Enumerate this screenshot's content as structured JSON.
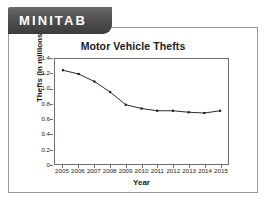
{
  "banner": {
    "wordmark": "MINITAB"
  },
  "chart_data": {
    "type": "line",
    "title": "Motor Vehicle Thefts",
    "xlabel": "Year",
    "ylabel": "Thefts (in millions)",
    "categories": [
      2005,
      2006,
      2007,
      2008,
      2009,
      2010,
      2011,
      2012,
      2013,
      2014,
      2015
    ],
    "x_tick_labels": [
      "2005",
      "2006",
      "2007",
      "2008",
      "2009",
      "2010",
      "2011",
      "2012",
      "2013",
      "2014",
      "2015"
    ],
    "values": [
      1.25,
      1.2,
      1.1,
      0.96,
      0.79,
      0.74,
      0.71,
      0.71,
      0.69,
      0.68,
      0.71
    ],
    "ylim": [
      0,
      1.4
    ],
    "y_ticks": [
      1.4,
      1.2,
      1.0,
      0.8,
      0.6,
      0.4,
      0.2,
      0
    ],
    "y_tick_labels": [
      "1.4",
      "1.2",
      "1.0",
      "0.8",
      "0.6",
      "0.4",
      "0.2",
      "0"
    ],
    "grid": false,
    "legend": "none",
    "marker": "square",
    "line_color": "#2b2b2b",
    "marker_color": "#1a1a1a",
    "panel_background": "#ffffff"
  },
  "colors": {
    "banner_dark": "#3c3c3c",
    "banner_light": "#6a6a6a",
    "card_border": "#9a9a9a",
    "axis": "#6f6f6f",
    "text": "#1a1a1a"
  }
}
